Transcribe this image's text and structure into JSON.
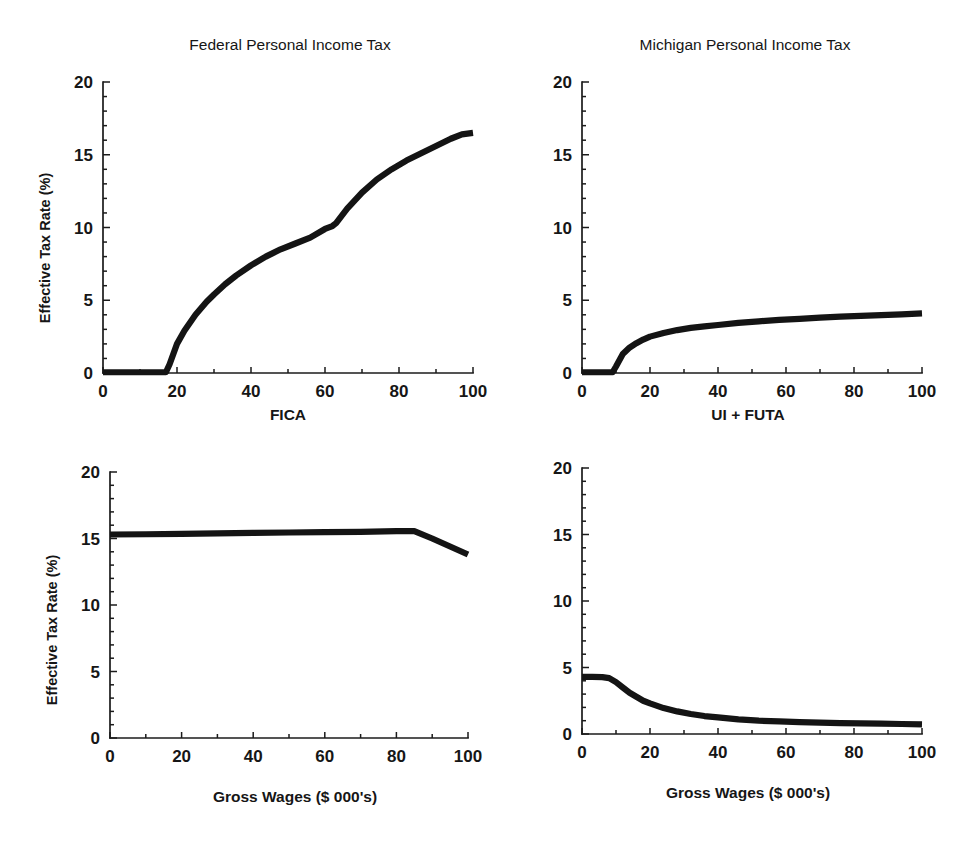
{
  "figure": {
    "background": "#ffffff",
    "line_color": "#141414",
    "axis_color": "#1b1b1b",
    "panel_count": 4
  },
  "chart_data": [
    {
      "id": "federal-fica",
      "type": "line",
      "title": "Federal Personal Income Tax",
      "xlabel": "FICA",
      "ylabel": "Effective Tax Rate (%)",
      "xlim": [
        0,
        100
      ],
      "ylim": [
        0,
        20
      ],
      "xticks": [
        0,
        20,
        40,
        60,
        80,
        100
      ],
      "yticks": [
        0,
        5,
        10,
        15,
        20
      ],
      "xtick_labels": [
        "0",
        "20",
        "40",
        "60",
        "80",
        "100"
      ],
      "ytick_labels": [
        "0",
        "5",
        "10",
        "15",
        "20"
      ],
      "grid": false,
      "legend": false,
      "x": [
        0,
        5,
        10,
        15,
        17,
        18,
        20,
        22,
        25,
        28,
        30,
        33,
        36,
        40,
        44,
        48,
        52,
        56,
        60,
        62,
        63,
        66,
        70,
        74,
        78,
        82,
        86,
        90,
        94,
        97,
        100
      ],
      "y": [
        0.05,
        0.05,
        0.05,
        0.05,
        0.05,
        0.6,
        2.0,
        2.9,
        4.0,
        4.9,
        5.4,
        6.1,
        6.7,
        7.4,
        8.0,
        8.5,
        8.9,
        9.3,
        9.9,
        10.1,
        10.3,
        11.3,
        12.4,
        13.3,
        14.0,
        14.6,
        15.1,
        15.6,
        16.1,
        16.4,
        16.5
      ]
    },
    {
      "id": "michigan-ui-futa",
      "type": "line",
      "title": "Michigan Personal Income Tax",
      "xlabel": "UI + FUTA",
      "ylabel": "",
      "xlim": [
        0,
        100
      ],
      "ylim": [
        0,
        20
      ],
      "xticks": [
        0,
        20,
        40,
        60,
        80,
        100
      ],
      "yticks": [
        0,
        5,
        10,
        15,
        20
      ],
      "xtick_labels": [
        "0",
        "20",
        "40",
        "60",
        "80",
        "100"
      ],
      "ytick_labels": [
        "0",
        "5",
        "10",
        "15",
        "20"
      ],
      "grid": false,
      "legend": false,
      "x": [
        0,
        3,
        6,
        9,
        10,
        12,
        14,
        16,
        18,
        20,
        24,
        28,
        32,
        36,
        40,
        46,
        52,
        58,
        64,
        70,
        76,
        82,
        88,
        94,
        100
      ],
      "y": [
        0.05,
        0.05,
        0.05,
        0.05,
        0.45,
        1.3,
        1.75,
        2.05,
        2.3,
        2.5,
        2.75,
        2.95,
        3.1,
        3.2,
        3.3,
        3.45,
        3.55,
        3.65,
        3.72,
        3.8,
        3.87,
        3.93,
        3.98,
        4.03,
        4.1
      ]
    },
    {
      "id": "federal-total",
      "type": "line",
      "title": "",
      "xlabel": "Gross Wages ($ 000's)",
      "ylabel": "Effective Tax Rate (%)",
      "xlim": [
        0,
        100
      ],
      "ylim": [
        0,
        20
      ],
      "xticks": [
        0,
        20,
        40,
        60,
        80,
        100
      ],
      "yticks": [
        0,
        5,
        10,
        15,
        20
      ],
      "xtick_labels": [
        "0",
        "20",
        "40",
        "60",
        "80",
        "100"
      ],
      "ytick_labels": [
        "0",
        "5",
        "10",
        "15",
        "20"
      ],
      "grid": false,
      "legend": false,
      "x": [
        0,
        10,
        20,
        30,
        40,
        50,
        60,
        70,
        80,
        85,
        90,
        95,
        100
      ],
      "y": [
        15.3,
        15.32,
        15.35,
        15.38,
        15.42,
        15.45,
        15.48,
        15.5,
        15.55,
        15.55,
        15.0,
        14.4,
        13.8
      ]
    },
    {
      "id": "michigan-total",
      "type": "line",
      "title": "",
      "xlabel": "Gross Wages ($ 000's)",
      "ylabel": "",
      "xlim": [
        0,
        100
      ],
      "ylim": [
        0,
        20
      ],
      "xticks": [
        0,
        20,
        40,
        60,
        80,
        100
      ],
      "yticks": [
        0,
        5,
        10,
        15,
        20
      ],
      "xtick_labels": [
        "0",
        "20",
        "40",
        "60",
        "80",
        "100"
      ],
      "ytick_labels": [
        "0",
        "5",
        "10",
        "15",
        "20"
      ],
      "grid": false,
      "legend": false,
      "x": [
        0,
        3,
        6,
        8,
        10,
        12,
        14,
        16,
        18,
        20,
        24,
        28,
        32,
        36,
        40,
        46,
        52,
        58,
        64,
        70,
        76,
        82,
        88,
        94,
        100
      ],
      "y": [
        4.3,
        4.3,
        4.28,
        4.2,
        3.9,
        3.5,
        3.1,
        2.8,
        2.5,
        2.3,
        1.95,
        1.7,
        1.5,
        1.35,
        1.25,
        1.1,
        1.0,
        0.95,
        0.9,
        0.85,
        0.82,
        0.8,
        0.78,
        0.75,
        0.72
      ]
    }
  ]
}
